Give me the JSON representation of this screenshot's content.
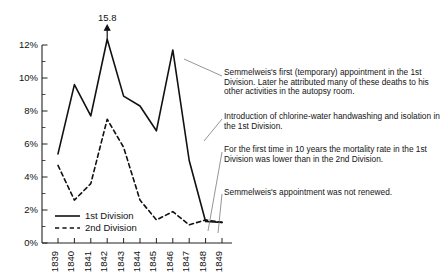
{
  "chart_data": {
    "type": "line",
    "title": "",
    "xlabel": "",
    "ylabel": "",
    "x": [
      1839,
      1840,
      1841,
      1842,
      1843,
      1844,
      1845,
      1846,
      1847,
      1848,
      1849
    ],
    "xticklabels": [
      "1839",
      "1840",
      "1841",
      "1842",
      "1843",
      "1844",
      "1845",
      "1846",
      "1847",
      "1848",
      "1849"
    ],
    "yticklabels": [
      "0%",
      "2%",
      "4%",
      "6%",
      "8%",
      "10%",
      "12%"
    ],
    "ytickvalues": [
      0,
      2,
      4,
      6,
      8,
      10,
      12
    ],
    "ylim": [
      0,
      12
    ],
    "xlim": [
      1839,
      1849
    ],
    "grid": false,
    "minor_ticks": true,
    "legend_position": "bottom-left",
    "series": [
      {
        "name": "1st Division",
        "style": "solid",
        "color": "#111111",
        "values": [
          5.4,
          9.6,
          7.7,
          15.8,
          8.9,
          8.3,
          6.8,
          11.7,
          5.0,
          1.3,
          1.25
        ]
      },
      {
        "name": "2nd Division",
        "style": "dashed",
        "color": "#111111",
        "values": [
          4.7,
          2.6,
          3.6,
          7.5,
          5.8,
          2.6,
          1.4,
          1.9,
          1.1,
          1.4,
          1.25
        ]
      }
    ],
    "annotations": [
      {
        "id": "peak-label",
        "text": "15.8",
        "x": 1842,
        "y": 15.8,
        "note": "clipped peak with arrow above axis maximum"
      }
    ],
    "callouts": [
      {
        "id": "callout-1846",
        "text": "Semmelweis's first (temporary) appointment in the 1st  Division. Later he attributed many of these deaths to his other activities in the autopsy room.",
        "target_year": 1846
      },
      {
        "id": "callout-1847",
        "text": "Introduction of chlorine-water handwashing and isolation in the 1st Division.",
        "target_year": 1847
      },
      {
        "id": "callout-1848",
        "text": "For the first time in 10 years the mortality rate in the 1st Division was lower than in the 2nd Division.",
        "target_year": 1848
      },
      {
        "id": "callout-1849",
        "text": "Semmelweis's appointment was not renewed.",
        "target_year": 1849
      }
    ]
  },
  "legend": {
    "entries": [
      {
        "label": "1st Division"
      },
      {
        "label": "2nd Division"
      }
    ]
  },
  "colors": {
    "ink": "#111111",
    "leader": "#7a7a7a",
    "background": "#ffffff"
  }
}
